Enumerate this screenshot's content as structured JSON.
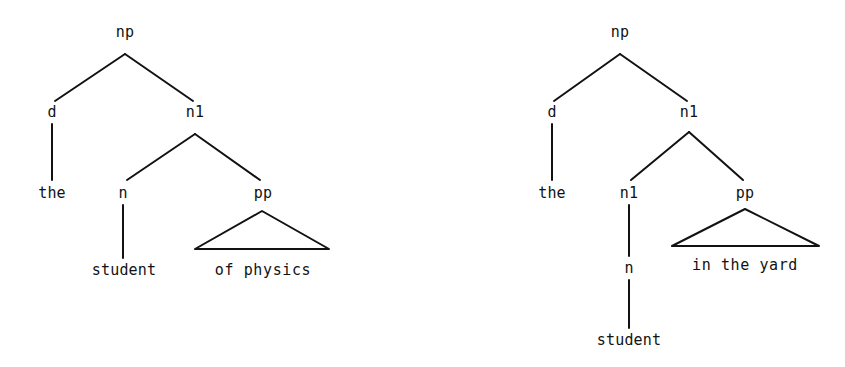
{
  "figure": {
    "kind": "syntax-tree-pair",
    "background_color": "#ffffff",
    "ink_color": "#121212"
  },
  "trees": [
    {
      "id": "tree-left",
      "phrase": "the student of physics",
      "nodes": [
        {
          "id": "np",
          "label": "np",
          "x": 125,
          "y": 32
        },
        {
          "id": "d",
          "label": "d",
          "x": 52,
          "y": 112
        },
        {
          "id": "n1",
          "label": "n1",
          "x": 195,
          "y": 112
        },
        {
          "id": "the",
          "label": "the",
          "x": 52,
          "y": 193
        },
        {
          "id": "n",
          "label": "n",
          "x": 123,
          "y": 193
        },
        {
          "id": "pp",
          "label": "pp",
          "x": 263,
          "y": 193
        },
        {
          "id": "student",
          "label": "student",
          "x": 124,
          "y": 270
        }
      ],
      "triangle": {
        "label": "of physics",
        "apex_x": 262,
        "apex_y": 211,
        "left_x": 195,
        "right_x": 329,
        "base_y": 249,
        "label_x": 263,
        "label_y": 270
      },
      "edges": [
        {
          "from": "np-apex",
          "x1": 125,
          "y1": 54,
          "x2": 55,
          "y2": 101
        },
        {
          "from": "np-apex",
          "x1": 125,
          "y1": 54,
          "x2": 193,
          "y2": 101
        },
        {
          "from": "d-stem",
          "x1": 52,
          "y1": 124,
          "x2": 52,
          "y2": 180
        },
        {
          "from": "n1-apex",
          "x1": 195,
          "y1": 134,
          "x2": 127,
          "y2": 180
        },
        {
          "from": "n1-apex",
          "x1": 195,
          "y1": 134,
          "x2": 260,
          "y2": 180
        },
        {
          "from": "n-stem",
          "x1": 123,
          "y1": 205,
          "x2": 123,
          "y2": 258
        }
      ]
    },
    {
      "id": "tree-right",
      "phrase": "the student in the yard",
      "nodes": [
        {
          "id": "np",
          "label": "np",
          "x": 620,
          "y": 32
        },
        {
          "id": "d",
          "label": "d",
          "x": 552,
          "y": 112
        },
        {
          "id": "n1-upper",
          "label": "n1",
          "x": 689,
          "y": 112
        },
        {
          "id": "the",
          "label": "the",
          "x": 552,
          "y": 193
        },
        {
          "id": "n1-lower",
          "label": "n1",
          "x": 629,
          "y": 193
        },
        {
          "id": "pp",
          "label": "pp",
          "x": 745,
          "y": 193
        },
        {
          "id": "n",
          "label": "n",
          "x": 629,
          "y": 268
        },
        {
          "id": "student",
          "label": "student",
          "x": 629,
          "y": 340
        }
      ],
      "triangle": {
        "label": "in the yard",
        "apex_x": 745,
        "apex_y": 209,
        "left_x": 672,
        "right_x": 819,
        "base_y": 246,
        "label_x": 745,
        "label_y": 265
      },
      "edges": [
        {
          "from": "np-apex",
          "x1": 620,
          "y1": 54,
          "x2": 554,
          "y2": 101
        },
        {
          "from": "np-apex",
          "x1": 620,
          "y1": 54,
          "x2": 687,
          "y2": 101
        },
        {
          "from": "d-stem",
          "x1": 552,
          "y1": 124,
          "x2": 552,
          "y2": 180
        },
        {
          "from": "n1-upper-apex",
          "x1": 689,
          "y1": 132,
          "x2": 631,
          "y2": 180
        },
        {
          "from": "n1-upper-apex",
          "x1": 689,
          "y1": 132,
          "x2": 743,
          "y2": 180
        },
        {
          "from": "n1-lower-stem",
          "x1": 629,
          "y1": 205,
          "x2": 629,
          "y2": 256
        },
        {
          "from": "n-stem",
          "x1": 629,
          "y1": 280,
          "x2": 629,
          "y2": 328
        }
      ]
    }
  ]
}
